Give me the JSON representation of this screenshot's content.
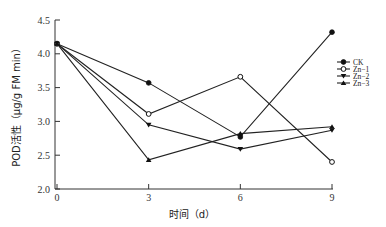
{
  "chart_data": {
    "type": "line",
    "title": "",
    "xlabel": "时间（d）",
    "ylabel": "POD活性（μg/g FM min）",
    "x": [
      0,
      3,
      6,
      9
    ],
    "x_tick_labels": [
      "0",
      "3",
      "6",
      "9"
    ],
    "y_tick_labels": [
      "2.0",
      "2.5",
      "3.0",
      "3.5",
      "4.0",
      "4.5"
    ],
    "ylim": [
      2.0,
      4.5
    ],
    "xlim": [
      0,
      9
    ],
    "grid": false,
    "legend_position": "right",
    "series": [
      {
        "name": "CK",
        "marker": "filled-circle",
        "values": [
          4.15,
          3.57,
          2.77,
          4.32
        ]
      },
      {
        "name": "Zn−1",
        "marker": "open-circle",
        "values": [
          4.15,
          3.11,
          3.66,
          2.4
        ]
      },
      {
        "name": "Zn−2",
        "marker": "down-triangle",
        "values": [
          4.15,
          2.95,
          2.59,
          2.87
        ]
      },
      {
        "name": "Zn−3",
        "marker": "up-triangle",
        "values": [
          4.15,
          2.43,
          2.82,
          2.92
        ]
      }
    ]
  }
}
